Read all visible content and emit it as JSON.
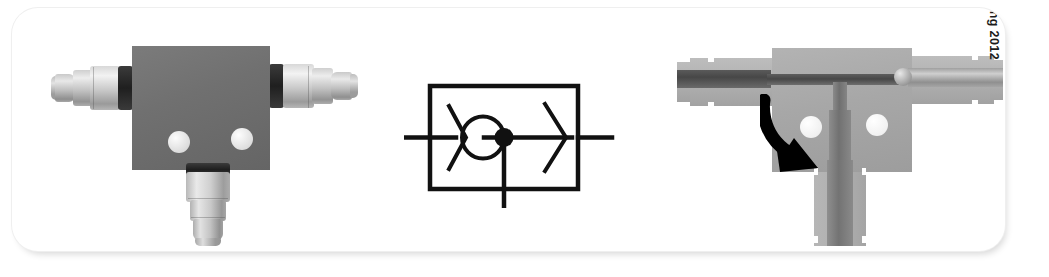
{
  "figure": {
    "caption_copyright": "© Cengage Learning 2012",
    "panels": [
      {
        "id": "photo",
        "name": "shuttle-valve-photograph",
        "description": "Photograph of a tee-shaped shuttle check valve body with three quick-connect push-to-connect fittings",
        "parts": [
          "left-horizontal-fitting",
          "right-horizontal-fitting",
          "bottom-vertical-fitting",
          "valve-body-block",
          "mounting-hole-left",
          "mounting-hole-right"
        ]
      },
      {
        "id": "symbol",
        "name": "shuttle-valve-iso-symbol",
        "description": "ISO fluid-power schematic symbol for a shuttle valve: enclosure rectangle with ball seat, junction dot and directional arrow",
        "elements": {
          "enclosure": "rectangle",
          "ball": "circle",
          "seat_left": "chevron-left",
          "arrow_right": "chevron-right",
          "junction": "filled-dot",
          "port_left": "horizontal-line",
          "port_right": "horizontal-line",
          "port_bottom": "vertical-line"
        }
      },
      {
        "id": "cutaway",
        "name": "shuttle-valve-cutaway",
        "description": "Sectioned cutaway of the same valve showing the internal bore, the shuttle ball seated at the right port, the vertical stem and a curved arrow indicating ball travel",
        "parts": [
          "left-port-bore",
          "right-port-bore",
          "shuttle-ball",
          "vertical-stem",
          "rotation-arrow",
          "mounting-hole-left",
          "mounting-hole-right"
        ]
      }
    ]
  },
  "colors": {
    "card_background": "#ffffff",
    "card_border": "#efefef",
    "body_block_photo": "#707070",
    "body_block_cutaway": "#a7a7a7",
    "metal_fitting_light": "#ededed",
    "metal_fitting_dark": "#8e8e8e",
    "bore_dark": "#474747",
    "symbol_line": "#111111",
    "arrow": "#000000",
    "text": "#1b1b1b"
  }
}
